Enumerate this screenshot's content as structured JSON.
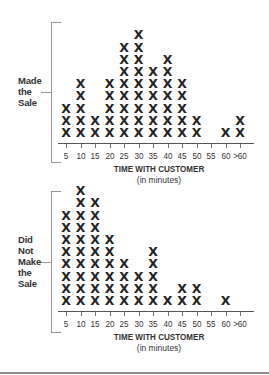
{
  "chart_data": [
    {
      "type": "dot",
      "title": "Made the Sale",
      "group_label": [
        "Made",
        "the",
        "Sale"
      ],
      "xlabel": "TIME WITH CUSTOMER",
      "xlabel_sub": "(in minutes)",
      "categories": [
        "5",
        "10",
        "15",
        "20",
        "25",
        "30",
        "35",
        "40",
        "45",
        "50",
        "55",
        "60",
        ">60"
      ],
      "values": [
        3,
        5,
        2,
        5,
        8,
        9,
        6,
        7,
        5,
        2,
        0,
        1,
        2
      ],
      "marker": "X",
      "grid": false
    },
    {
      "type": "dot",
      "title": "Did Not Make the Sale",
      "group_label": [
        "Did",
        "Not",
        "Make",
        "the",
        "Sale"
      ],
      "xlabel": "TIME WITH CUSTOMER",
      "xlabel_sub": "(in minutes)",
      "categories": [
        "5",
        "10",
        "15",
        "20",
        "25",
        "30",
        "35",
        "40",
        "45",
        "50",
        "55",
        "60",
        ">60"
      ],
      "values": [
        8,
        10,
        9,
        6,
        4,
        3,
        5,
        1,
        2,
        2,
        0,
        1,
        0
      ],
      "marker": "X",
      "grid": false
    }
  ],
  "panels": [
    {
      "label_lines": [
        "Made",
        "the",
        "Sale"
      ],
      "xlabel": "TIME WITH CUSTOMER",
      "xlabel_sub": "(in minutes)",
      "ticks": [
        "5",
        "10",
        "15",
        "20",
        "25",
        "30",
        "35",
        "40",
        "45",
        "50",
        "55",
        "60",
        ">60"
      ]
    },
    {
      "label_lines": [
        "Did",
        "Not",
        "Make",
        "the",
        "Sale"
      ],
      "xlabel": "TIME WITH CUSTOMER",
      "xlabel_sub": "(in minutes)",
      "ticks": [
        "5",
        "10",
        "15",
        "20",
        "25",
        "30",
        "35",
        "40",
        "45",
        "50",
        "55",
        "60",
        ">60"
      ]
    }
  ]
}
